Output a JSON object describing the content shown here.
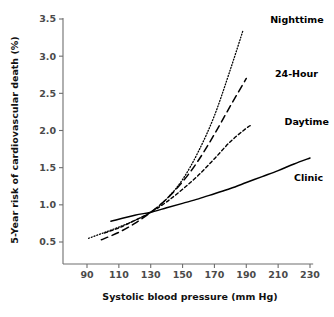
{
  "chart_data": {
    "type": "line",
    "title": "",
    "xlabel": "Systolic blood pressure (mm Hg)",
    "ylabel": "5-Year risk of cardiovascular death (%)",
    "xlim": [
      83,
      237
    ],
    "ylim": [
      0.32,
      3.55
    ],
    "xticks": [
      90,
      110,
      130,
      150,
      170,
      190,
      210,
      230
    ],
    "xticklabels": [
      "90",
      "110",
      "130",
      "150",
      "170",
      "190",
      "210",
      "230"
    ],
    "yticks": [
      0.5,
      1.0,
      1.5,
      2.0,
      2.5,
      3.0,
      3.5
    ],
    "yticklabels": [
      "0.5",
      "1.0",
      "1.5",
      "2.0",
      "2.5",
      "3.0",
      "3.5"
    ],
    "grid": false,
    "legend_position": "inline-annotations",
    "series": [
      {
        "name": "Nighttime",
        "style": "dotted",
        "label_x": 205,
        "label_y": 3.45,
        "x": [
          91,
          100,
          110,
          120,
          130,
          140,
          150,
          160,
          170,
          180,
          188
        ],
        "y": [
          0.55,
          0.62,
          0.7,
          0.79,
          0.9,
          1.08,
          1.34,
          1.72,
          2.2,
          2.82,
          3.35
        ]
      },
      {
        "name": "24-Hour",
        "style": "dashed-long",
        "label_x": 208,
        "label_y": 2.72,
        "x": [
          99,
          110,
          120,
          130,
          140,
          150,
          160,
          170,
          180,
          190
        ],
        "y": [
          0.53,
          0.63,
          0.75,
          0.9,
          1.08,
          1.31,
          1.6,
          1.95,
          2.33,
          2.7
        ]
      },
      {
        "name": "Daytime",
        "style": "dashed-short",
        "label_x": 214,
        "label_y": 2.08,
        "x": [
          101,
          110,
          120,
          130,
          140,
          150,
          160,
          170,
          180,
          190,
          193
        ],
        "y": [
          0.62,
          0.69,
          0.79,
          0.9,
          1.04,
          1.21,
          1.4,
          1.62,
          1.85,
          2.03,
          2.07
        ]
      },
      {
        "name": "Clinic",
        "style": "solid",
        "label_x": 220,
        "label_y": 1.32,
        "x": [
          105,
          120,
          130,
          140,
          150,
          160,
          170,
          180,
          190,
          200,
          210,
          220,
          230
        ],
        "y": [
          0.78,
          0.86,
          0.9,
          0.96,
          1.02,
          1.08,
          1.15,
          1.22,
          1.3,
          1.38,
          1.46,
          1.55,
          1.63
        ]
      }
    ]
  }
}
